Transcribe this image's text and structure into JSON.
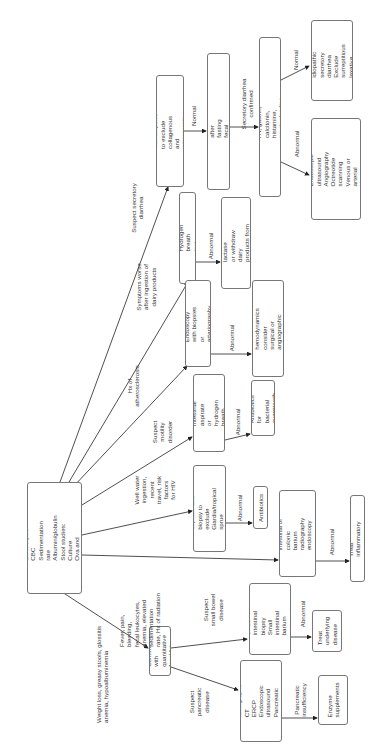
{
  "diagram": {
    "type": "flowchart",
    "orientation": "rotated-90-ccw",
    "root": {
      "text": "History and physical\nPertinent laboratory tests:\n   Electrolytes\n   CBC\n   Sedimentation rate\n   Albumin/globulin\nStool studies:\n   Culture\n   Ova and parasites\n   Qualitative fat\nFlexible sigmoidoscopy\n+/– biopsies"
    },
    "nodes": {
      "colonoscopy": "Colonoscopy with biopsies\nto exclude collagenous and\nmicroscopic colitis",
      "stool_volume": "Stool volume before and after fasting\nfecal electrolytes and osmolarity",
      "plasma_vip": "Plasma VIP, 5-HT, gastrin, calcitonin, histamine,\nprostaglandins, urine 5-HIAA",
      "assess_idiopathic": "Assess for idiopathic\nsecretory diarrhea\nExclude surreptitious\nlaxative abuse",
      "ct_tests": "CT\nEndoscopic ultrasound\nAngiography\nOctreotide scanning\nVenous or arterial blood\nsampling",
      "hydrogen_breath": "Hydrogen breath test",
      "supplemental_lactase": "Supplemental lactase\nor withdraw dairy\nproducts from diet",
      "endoscopy_biopsies": "Endoscopy with biopsies\nor arteriography",
      "improve_hemodynamics": "Improve hemodynamics\nconsider surgical or\nangiographic therapy",
      "small_intestinal_aspirate": "Small intestinal\naspirate or hydrogen\nbreath test",
      "antibiotics_bacterial": "Antibiotics for\nbacterial\novergrowth",
      "intestinal_aspirate_giardia": "Intestinal aspirate and\nbiopsy to exclude\nGiardia/tropical sprue\nopportunistic infection",
      "antibiotics": "Antibiotics",
      "barium_radiography": "Small intestinal or colonic\nbarium radiography\nendoscopy with biopsies",
      "treat_inflammatory": "Treat inflammatory disease",
      "confirm_fecal_fat": "Confirm with\nquantitative\nfecal fat",
      "small_intestinal_biopsy": "Small intestinal\nbiopsy\nSmall intestinal\nbarium radiography",
      "treat_underlying": "Treat\nunderlying\ndisease",
      "abdominal_radiographs": "Abdominal\nradiographs\nCT\nERCP\nEndoscopic\nultrasound\nPancreatic\nfunction tests",
      "enzyme_supplements": "Enzyme\nsupplements"
    },
    "edge_labels": {
      "suspect_secretory": "Suspect secretory\ndiarrhea",
      "symptoms_dairy": "Symptoms worse\nafter ingestion of\ndairy products",
      "hx_atherosclerosis": "Hx of\natherosclerosis",
      "suspect_motility": "Suspect\nmotility\ndisorder",
      "well_water": "Well  water\ningestion,\nrecent\ntravel, risk\nfactors\nfor HIV",
      "fever_pain": "Fever, pain,\nbleeding,\nfecal leukocytes,\nanemia, elevated\nsedimentation\nrate, Hx of radiation",
      "weight_loss": "Weight loss, greasy stools, glossitis\nanemia, hypoalbuminemia",
      "normal_1": "Normal",
      "secretory_confirmed": "Secretory diarrhea\nconfirmed",
      "normal_2": "Normal",
      "abnormal_plasma": "Abnormal",
      "abnormal_hydrogen": "Abnormal",
      "abnormal_endoscopy": "Abnormal",
      "abnormal_aspirate": "Abnormal",
      "abnormal_giardia": "Abnormal",
      "abnormal_barium": "Abnormal",
      "suspect_small_bowel": "Suspect\nsmall bowel\ndisease",
      "suspect_pancreatic": "Suspect\npancreatic\ndisease",
      "abnormal_small_biopsy": "Abnormal",
      "pancreatic_insufficiency": "Pancreatic\ninsufficiency"
    }
  }
}
